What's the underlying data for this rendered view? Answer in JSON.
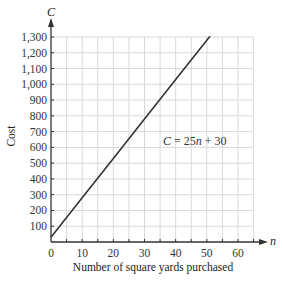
{
  "chart_data": {
    "type": "line",
    "title": "",
    "xlabel": "Number of square yards purchased",
    "ylabel": "Cost",
    "x_axis_variable": "n",
    "y_axis_variable": "C",
    "xlim": [
      0,
      65
    ],
    "ylim": [
      0,
      1300
    ],
    "x_ticks": [
      0,
      10,
      20,
      30,
      40,
      50,
      60
    ],
    "x_tick_labels": [
      "0",
      "10",
      "20",
      "30",
      "40",
      "50",
      "60"
    ],
    "y_ticks": [
      100,
      200,
      300,
      400,
      500,
      600,
      700,
      800,
      900,
      1000,
      1100,
      1200,
      1300
    ],
    "y_tick_labels": [
      "100",
      "200",
      "300",
      "400",
      "500",
      "600",
      "700",
      "800",
      "900",
      "1,000",
      "1,100",
      "1,200",
      "1,300"
    ],
    "grid": true,
    "grid_x_step": 5,
    "grid_y_step": 100,
    "series": [
      {
        "name": "C = 25n + 30",
        "equation": "C = 25n + 30",
        "x": [
          0,
          10,
          20,
          30,
          40,
          50,
          51
        ],
        "values": [
          30,
          280,
          530,
          780,
          1030,
          1280,
          1305
        ],
        "color": "#333333"
      }
    ],
    "annotations": [
      {
        "text": "C = 25n + 30",
        "x": 34,
        "y": 650
      }
    ]
  },
  "labels": {
    "y_var": "C",
    "x_var": "n",
    "ylabel": "Cost",
    "xlabel": "Number of square yards purchased",
    "eq_C": "C",
    "eq_rest": " = 25",
    "eq_n": "n",
    "eq_tail": " + 30"
  },
  "colors": {
    "grid": "#d9d9d9",
    "axis": "#333333",
    "line": "#333333"
  }
}
